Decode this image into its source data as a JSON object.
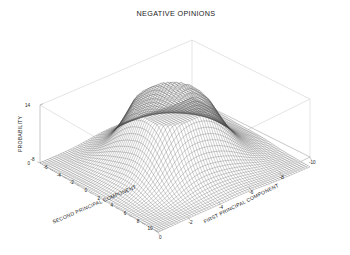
{
  "figure": {
    "title": "NEGATIVE OPINIONS",
    "background_color": "#ffffff",
    "axis_line_color": "#9a9a9a",
    "box_line_color": "#c9c9c9",
    "mesh_color": "#4a4a4a",
    "text_color": "#1a1a1a"
  },
  "chart_data": {
    "type": "surface",
    "title": "NEGATIVE OPINIONS",
    "xlabel": "FIRST PRINCIPAL COMPONENT",
    "ylabel": "SECOND PRINCIPAL COMPONENT",
    "zlabel": "PROBABILITY",
    "xlim": [
      -10,
      0
    ],
    "ylim": [
      -8,
      10
    ],
    "zlim": [
      0,
      14
    ],
    "grid": false,
    "legend": null,
    "projection": "3d-mesh",
    "x_ticks": [
      0,
      -2,
      -4,
      -6,
      -8,
      -10
    ],
    "x_tick_labels": [
      "0",
      "-2",
      "-4",
      "-6",
      "-8",
      "-10"
    ],
    "y_ticks": [
      -8,
      -6,
      -4,
      -2,
      0,
      2,
      4,
      6,
      8,
      10
    ],
    "y_tick_labels": [
      "-8",
      "-6",
      "-4",
      "-2",
      "0",
      "2",
      "4",
      "6",
      "8",
      "10"
    ],
    "z_ticks": [
      0,
      14
    ],
    "z_tick_labels": [
      "0",
      "14"
    ],
    "peaks": [
      {
        "x": -5.0,
        "y": 1.0,
        "z": 14.0,
        "label": "primary-peak"
      },
      {
        "x": -3.2,
        "y": 4.2,
        "z": 7.5,
        "label": "secondary-ridge-right"
      },
      {
        "x": -6.8,
        "y": -1.5,
        "z": 6.0,
        "label": "secondary-ridge-left"
      }
    ],
    "surface_grid": {
      "nx": 60,
      "ny": 60
    },
    "z_baseline": 0
  },
  "axes": {
    "z": {
      "label": "PROBABILITY",
      "ticks": [
        {
          "value": 14,
          "label": "14"
        },
        {
          "value": 0,
          "label": "0"
        }
      ]
    },
    "y": {
      "label": "SECOND PRINCIPAL COMPONENT",
      "ticks": [
        {
          "value": -8,
          "label": "-8"
        },
        {
          "value": -6,
          "label": "-6"
        },
        {
          "value": -4,
          "label": "-4"
        },
        {
          "value": -2,
          "label": "-2"
        },
        {
          "value": 0,
          "label": "0"
        },
        {
          "value": 2,
          "label": "2"
        },
        {
          "value": 4,
          "label": "4"
        },
        {
          "value": 6,
          "label": "6"
        },
        {
          "value": 8,
          "label": "8"
        },
        {
          "value": 10,
          "label": "10"
        }
      ]
    },
    "x": {
      "label": "FIRST PRINCIPAL COMPONENT",
      "ticks": [
        {
          "value": 0,
          "label": "0"
        },
        {
          "value": -2,
          "label": "-2"
        },
        {
          "value": -4,
          "label": "-4"
        },
        {
          "value": -6,
          "label": "-6"
        },
        {
          "value": -8,
          "label": "-8"
        },
        {
          "value": -10,
          "label": "-10"
        }
      ]
    }
  }
}
